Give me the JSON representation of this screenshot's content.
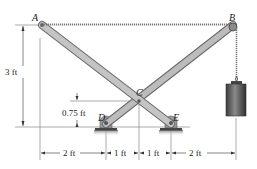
{
  "diagram": {
    "points": {
      "A": "A",
      "B": "B",
      "C": "C",
      "D": "D",
      "E": "E"
    },
    "dimensions": {
      "height_total": "3 ft",
      "height_C": "0.75 ft",
      "spans": [
        "2 ft",
        "1 ft",
        "1 ft",
        "2 ft"
      ]
    },
    "colors": {
      "bar_fill": "#b9b9b9",
      "bar_edge": "#6a6a6a",
      "rope": "#8a8a8a",
      "weight_fill": "#5e5e5e",
      "support_fill": "#444444"
    }
  }
}
